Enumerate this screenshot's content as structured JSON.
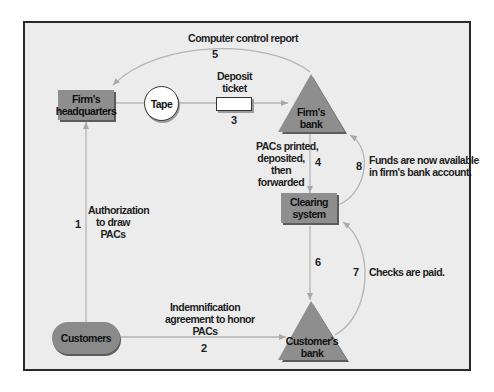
{
  "nodes": {
    "firms_headquarters": {
      "line1": "Firm's",
      "line2": "headquarters"
    },
    "tape": {
      "label": "Tape"
    },
    "deposit_ticket": {
      "line1": "Deposit",
      "line2": "ticket"
    },
    "firms_bank": {
      "line1": "Firm's",
      "line2": "bank"
    },
    "clearing_system": {
      "line1": "Clearing",
      "line2": "system"
    },
    "customers": {
      "label": "Customers"
    },
    "customers_bank": {
      "line1": "Customer's",
      "line2": "bank"
    }
  },
  "flows": [
    {
      "step": "1",
      "lines": [
        "Authorization",
        "to draw",
        "PACs"
      ]
    },
    {
      "step": "2",
      "lines": [
        "Indemnification",
        "agreement to honor",
        "PACs"
      ]
    },
    {
      "step": "3",
      "lines": []
    },
    {
      "step": "4",
      "lines": [
        "PACs printed,",
        "deposited,",
        "then",
        "forwarded"
      ]
    },
    {
      "step": "5",
      "lines": [
        "Computer control report"
      ]
    },
    {
      "step": "6",
      "lines": []
    },
    {
      "step": "7",
      "lines": [
        "Checks are paid."
      ]
    },
    {
      "step": "8",
      "lines": [
        "Funds are now available",
        "in firm's bank account."
      ]
    }
  ],
  "colors": {
    "background": "#ececec",
    "node_fill": "#8e8e8e",
    "connector": "#b4b4b4",
    "frame_border": "#2a2a2a"
  }
}
